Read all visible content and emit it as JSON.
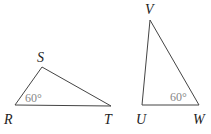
{
  "triangles": [
    {
      "name": "RST",
      "vertices": {
        "R": "R",
        "S": "S",
        "T": "T"
      },
      "angle_label": "60°",
      "angle_at": "R"
    },
    {
      "name": "UVW",
      "vertices": {
        "U": "U",
        "V": "V",
        "W": "W"
      },
      "angle_label": "60°",
      "angle_at": "W"
    }
  ],
  "colors": {
    "edge": "#444444",
    "angle_text": "#888888",
    "label_text": "#222222"
  }
}
